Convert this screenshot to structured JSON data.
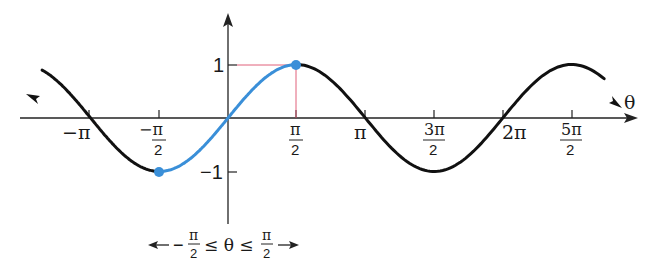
{
  "chart_data": {
    "type": "line",
    "title": "",
    "xlabel": "θ",
    "ylabel": "",
    "function": "sin θ",
    "xlim": [
      -4.6,
      9.0
    ],
    "ylim": [
      -1.6,
      1.6
    ],
    "grid": false,
    "x_ticks": [
      {
        "value": -3.1416,
        "num": "−π",
        "den": ""
      },
      {
        "value": -1.5708,
        "num": "−π",
        "den": "2"
      },
      {
        "value": 1.5708,
        "num": "π",
        "den": "2"
      },
      {
        "value": 3.1416,
        "num": "π",
        "den": ""
      },
      {
        "value": 4.7124,
        "num": "3π",
        "den": "2"
      },
      {
        "value": 6.2832,
        "num": "2π",
        "den": ""
      },
      {
        "value": 7.854,
        "num": "5π",
        "den": "2"
      }
    ],
    "y_ticks": [
      {
        "value": 1,
        "label": "1"
      },
      {
        "value": -1,
        "label": "−1"
      }
    ],
    "series": [
      {
        "name": "sin θ (full curve)",
        "color": "#111111",
        "x_range": [
          -4.3,
          8.7
        ]
      },
      {
        "name": "restricted sin θ, −π/2 ≤ θ ≤ π/2",
        "color": "#3a8fd8",
        "x_range": [
          -1.5708,
          1.5708
        ]
      }
    ],
    "points": [
      {
        "x": -1.5708,
        "y": -1,
        "color": "#3a8fd8"
      },
      {
        "x": 1.5708,
        "y": 1,
        "color": "#3a8fd8"
      }
    ],
    "guide_lines_color": "#e0607a",
    "annotation": {
      "left": "−",
      "num": "π",
      "den": "2",
      "mid": "≤ θ ≤",
      "right_num": "π",
      "right_den": "2"
    }
  }
}
